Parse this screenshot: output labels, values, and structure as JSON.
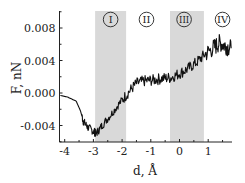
{
  "chart_data": {
    "type": "line",
    "title": "",
    "xlabel": "d, Å",
    "ylabel": "F, nN",
    "xlim": [
      -4.15,
      1.83
    ],
    "ylim": [
      -0.006,
      0.0101
    ],
    "xticks": [
      -4,
      -3,
      -2,
      -1,
      0,
      1
    ],
    "xtick_labels": [
      "-4",
      "-3",
      "-2",
      "-1",
      "0",
      "1"
    ],
    "yticks": [
      -0.004,
      0.0,
      0.004,
      0.008
    ],
    "ytick_labels": [
      "-0.004",
      "0.000",
      "0.004",
      "0.008"
    ],
    "grid": false,
    "legend": null,
    "series": [
      {
        "name": "F(d)",
        "color": "#111111",
        "x": [
          -4.15,
          -3.9,
          -3.6,
          -3.45,
          -3.35,
          -3.2,
          -3.0,
          -2.9,
          -2.7,
          -2.4,
          -2.1,
          -1.8,
          -1.5,
          -1.2,
          -0.9,
          -0.6,
          -0.3,
          0.0,
          0.3,
          0.6,
          0.9,
          1.2,
          1.4,
          1.6,
          1.8
        ],
        "y": [
          -0.0003,
          -0.0005,
          -0.001,
          -0.0022,
          -0.0035,
          -0.0042,
          -0.0047,
          -0.005,
          -0.004,
          -0.0027,
          -0.0013,
          0.0,
          0.0012,
          0.0015,
          0.0016,
          0.0018,
          0.0019,
          0.0024,
          0.003,
          0.0038,
          0.0048,
          0.0056,
          0.0062,
          0.0058,
          0.0055
        ]
      }
    ],
    "shaded_regions": [
      {
        "label": "I",
        "x_start": -2.94,
        "x_end": -1.86,
        "color": "#d9d9d9"
      },
      {
        "label": "III",
        "x_start": -0.33,
        "x_end": 0.85,
        "color": "#d9d9d9"
      }
    ],
    "annotations": [
      {
        "text": "I",
        "x": -2.4,
        "style": "circled"
      },
      {
        "text": "II",
        "x": -1.15,
        "style": "circled"
      },
      {
        "text": "III",
        "x": 0.16,
        "style": "circled"
      },
      {
        "text": "IV",
        "x": 1.5,
        "style": "circled"
      }
    ]
  }
}
